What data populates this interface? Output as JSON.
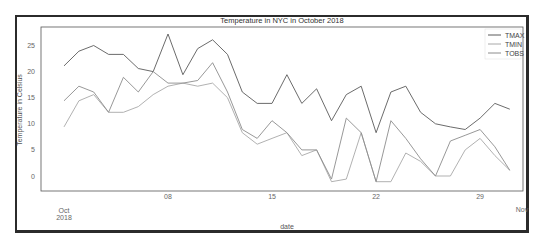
{
  "chart_data": {
    "type": "line",
    "title": "Temperature in NYC in October 2018",
    "xlabel": "date",
    "ylabel": "Temperature in Celsius",
    "x": [
      1,
      2,
      3,
      4,
      5,
      6,
      7,
      8,
      9,
      10,
      11,
      12,
      13,
      14,
      15,
      16,
      17,
      18,
      19,
      20,
      21,
      22,
      23,
      24,
      25,
      26,
      27,
      28,
      29,
      30,
      31
    ],
    "x_tick_labels": [
      {
        "day": 1,
        "label": "Oct\n2018"
      },
      {
        "day": 8,
        "label": "08"
      },
      {
        "day": 15,
        "label": "15"
      },
      {
        "day": 22,
        "label": "22"
      },
      {
        "day": 29,
        "label": "29"
      },
      {
        "day": 32,
        "label": "Nov"
      }
    ],
    "y_ticks": [
      0,
      5,
      10,
      15,
      20,
      25
    ],
    "ylim": [
      -2.5,
      28.5
    ],
    "xlim": [
      -0.5,
      32
    ],
    "grid": false,
    "legend_position": "upper right",
    "series": [
      {
        "name": "TMAX",
        "color": "#5a5a5a",
        "values": [
          21.1,
          23.9,
          25.0,
          23.3,
          23.3,
          20.6,
          20.0,
          27.2,
          19.4,
          24.4,
          26.1,
          23.3,
          16.1,
          13.9,
          13.9,
          19.4,
          13.9,
          16.7,
          10.6,
          15.6,
          17.2,
          8.3,
          16.1,
          17.2,
          12.2,
          10.0,
          9.4,
          8.9,
          11.1,
          13.9,
          12.8
        ]
      },
      {
        "name": "TMIN",
        "color": "#a8a8a8",
        "values": [
          9.4,
          14.4,
          15.6,
          12.2,
          12.2,
          13.3,
          15.6,
          17.2,
          17.8,
          17.2,
          17.8,
          15.0,
          8.3,
          6.1,
          7.2,
          8.3,
          3.9,
          5.0,
          -1.1,
          -0.6,
          8.3,
          -1.1,
          -1.1,
          4.4,
          2.8,
          0.0,
          0.0,
          5.0,
          7.2,
          3.9,
          1.1
        ]
      },
      {
        "name": "TOBS",
        "color": "#8c8c8c",
        "values": [
          14.4,
          17.2,
          16.1,
          12.2,
          18.9,
          16.1,
          20.0,
          17.8,
          17.8,
          18.3,
          21.7,
          16.1,
          8.9,
          7.2,
          10.6,
          8.3,
          5.0,
          5.0,
          -0.6,
          11.1,
          8.3,
          -1.1,
          10.6,
          7.2,
          3.3,
          0.0,
          6.7,
          7.8,
          8.9,
          5.6,
          1.1
        ]
      }
    ]
  },
  "legend": {
    "items": [
      {
        "label": "TMAX",
        "color": "#5a5a5a"
      },
      {
        "label": "TMIN",
        "color": "#a8a8a8"
      },
      {
        "label": "TOBS",
        "color": "#8c8c8c"
      }
    ]
  }
}
